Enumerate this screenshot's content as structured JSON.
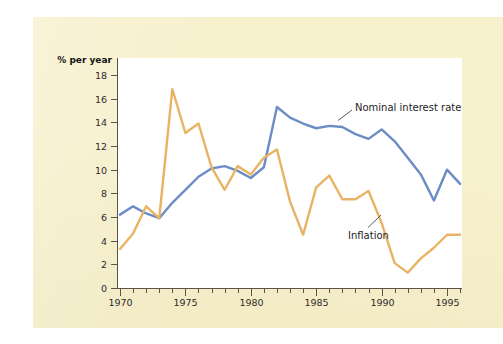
{
  "figure": {
    "background_color": "#f7f0cc",
    "plot_background_color": "#ffffff",
    "axis_color": "#5a5547"
  },
  "chart_data": {
    "type": "line",
    "title": "",
    "subtitle": "",
    "xlabel": "",
    "ylabel": "% per year",
    "ylabel_position": "top-left",
    "xlim": [
      1970,
      1996
    ],
    "ylim": [
      0,
      18
    ],
    "y_ticks": [
      0,
      2,
      4,
      6,
      8,
      10,
      12,
      14,
      16,
      18
    ],
    "y_tick_labels": [
      "0",
      "2",
      "4",
      "6",
      "8",
      "10",
      "12",
      "14",
      "16",
      "18"
    ],
    "x_ticks": [
      1970,
      1971,
      1972,
      1973,
      1974,
      1975,
      1976,
      1977,
      1978,
      1979,
      1980,
      1981,
      1982,
      1983,
      1984,
      1985,
      1986,
      1987,
      1988,
      1989,
      1990,
      1991,
      1992,
      1993,
      1994,
      1995,
      1996
    ],
    "x_tick_labels_shown": [
      "1970",
      "1975",
      "1980",
      "1985",
      "1990",
      "1995"
    ],
    "x_labeled_ticks": [
      1970,
      1975,
      1980,
      1985,
      1990,
      1995
    ],
    "grid": false,
    "legend": "annotated-inline",
    "x": [
      1970,
      1971,
      1972,
      1973,
      1974,
      1975,
      1976,
      1977,
      1978,
      1979,
      1980,
      1981,
      1982,
      1983,
      1984,
      1985,
      1986,
      1987,
      1988,
      1989,
      1990,
      1991,
      1992,
      1993,
      1994,
      1995,
      1996
    ],
    "series": [
      {
        "name": "Nominal interest rate",
        "color": "#6b8cc4",
        "values": [
          6.2,
          6.9,
          6.3,
          5.9,
          7.2,
          8.3,
          9.4,
          10.1,
          10.3,
          9.9,
          9.3,
          10.2,
          15.3,
          14.4,
          13.9,
          13.5,
          13.7,
          13.6,
          13.0,
          12.6,
          13.4,
          12.4,
          11.0,
          9.6,
          7.4,
          10.0,
          8.8
        ]
      },
      {
        "name": "Inflation",
        "color": "#e8b464",
        "values": [
          3.3,
          4.6,
          6.9,
          5.9,
          16.8,
          13.1,
          13.9,
          10.2,
          8.3,
          10.3,
          9.6,
          11.0,
          11.7,
          7.3,
          4.5,
          8.5,
          9.5,
          7.5,
          7.5,
          8.2,
          5.5,
          2.1,
          1.3,
          2.5,
          3.4,
          4.5,
          4.5
        ]
      }
    ],
    "annotations": [
      {
        "text": "Nominal interest rate",
        "series": "Nominal interest rate"
      },
      {
        "text": "Inflation",
        "series": "Inflation"
      }
    ]
  }
}
